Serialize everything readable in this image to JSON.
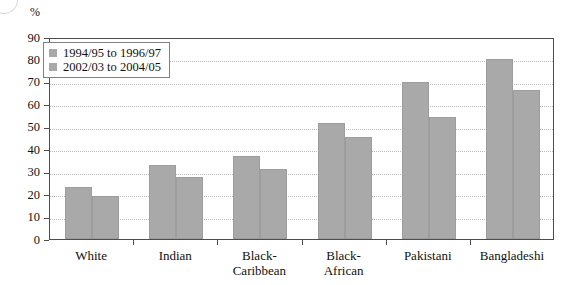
{
  "axes": {
    "unit_label": "%",
    "y_ticks": [
      0,
      10,
      20,
      30,
      40,
      50,
      60,
      70,
      80,
      90
    ]
  },
  "legend": {
    "entries": [
      {
        "label": "1994/95 to 1996/97",
        "color": "#a9a9a9"
      },
      {
        "label": "2002/03 to 2004/05",
        "color": "#a9a9a9"
      }
    ]
  },
  "categories": [
    {
      "line1": "White",
      "line2": ""
    },
    {
      "line1": "Indian",
      "line2": ""
    },
    {
      "line1": "Black-",
      "line2": "Caribbean"
    },
    {
      "line1": "Black-",
      "line2": "African"
    },
    {
      "line1": "Pakistani",
      "line2": ""
    },
    {
      "line1": "Bangladeshi",
      "line2": ""
    }
  ],
  "chart_data": {
    "type": "bar",
    "title": "",
    "xlabel": "",
    "ylabel": "%",
    "ylim": [
      0,
      90
    ],
    "ytick_step": 10,
    "grid": true,
    "legend_position": "top-left-inside",
    "categories": [
      "White",
      "Indian",
      "Black-Caribbean",
      "Black-African",
      "Pakistani",
      "Bangladeshi"
    ],
    "series": [
      {
        "name": "1994/95 to 1996/97",
        "color": "#a9a9a9",
        "values": [
          23,
          33,
          37,
          51.5,
          70,
          80
        ]
      },
      {
        "name": "2002/03 to 2004/05",
        "color": "#a9a9a9",
        "values": [
          19,
          27.5,
          31,
          45.5,
          54.5,
          66.5
        ]
      }
    ]
  }
}
